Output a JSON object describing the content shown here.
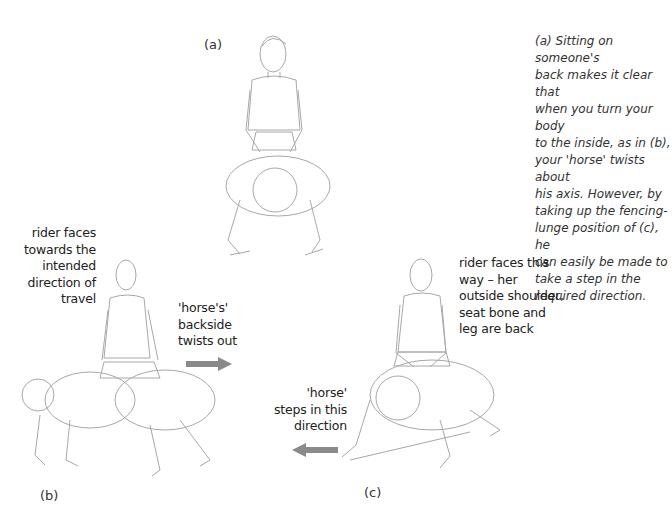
{
  "figure": {
    "panel_labels": {
      "a": "(a)",
      "b": "(b)",
      "c": "(c)"
    },
    "caption_lines": [
      "(a) Sitting on someone's",
      "back makes it clear that",
      "when you turn your body",
      "to the inside, as in (b),",
      "your 'horse' twists about",
      "his axis. However, by",
      "taking up the fencing-",
      "lunge position of (c), he",
      "can easily be made to",
      "take a step in the",
      "required direction."
    ],
    "annotations": {
      "b_rider": [
        "rider faces",
        "towards the",
        "intended",
        "direction of",
        "travel"
      ],
      "b_horse": [
        "'horse's'",
        "backside",
        "twists out"
      ],
      "c_rider": [
        "rider faces this",
        "way – her",
        "outside shoulder,",
        "seat bone and",
        "leg are back"
      ],
      "c_horse": [
        "'horse'",
        "steps in this",
        "direction"
      ]
    },
    "arrows": {
      "b_direction": "right",
      "c_direction": "left",
      "color": "#8a8a8a"
    },
    "line_color": "#9a9a9a"
  }
}
